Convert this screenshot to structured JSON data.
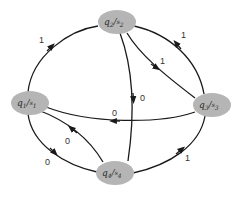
{
  "diagram": {
    "type": "state-machine",
    "colors": {
      "node_fill": "#b5b5b5",
      "edge": "#1a1a1a",
      "text": "#2a2a2a"
    },
    "nodes": [
      {
        "id": "q1",
        "q": "q",
        "q_sub": "1",
        "s": "s",
        "s_sub": "1",
        "label": "q1/s1",
        "cx": 30,
        "cy": 103
      },
      {
        "id": "q2",
        "q": "q",
        "q_sub": "2",
        "s": "s",
        "s_sub": "2",
        "label": "q2/s2",
        "cx": 117,
        "cy": 22
      },
      {
        "id": "q3",
        "q": "q",
        "q_sub": "3",
        "s": "s",
        "s_sub": "3",
        "label": "q3/s3",
        "cx": 212,
        "cy": 105
      },
      {
        "id": "q4",
        "q": "q",
        "q_sub": "4",
        "s": "s",
        "s_sub": "4",
        "label": "q4/s4",
        "cx": 115,
        "cy": 173
      }
    ],
    "edges": [
      {
        "from": "q1",
        "to": "q2",
        "label": "1"
      },
      {
        "from": "q3",
        "to": "q2",
        "label": "1"
      },
      {
        "from": "q2",
        "to": "q3",
        "label": "1"
      },
      {
        "from": "q2",
        "to": "q4",
        "label": "0"
      },
      {
        "from": "q3",
        "to": "q1",
        "label": "0"
      },
      {
        "from": "q4",
        "to": "q1",
        "label": "0"
      },
      {
        "from": "q1",
        "to": "q4",
        "label": "0"
      },
      {
        "from": "q4",
        "to": "q3",
        "label": "1"
      }
    ]
  }
}
